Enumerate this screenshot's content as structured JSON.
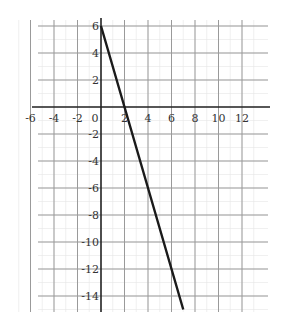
{
  "chart_data": {
    "type": "line",
    "title": "",
    "xlabel": "",
    "ylabel": "",
    "xlim": [
      -7,
      13
    ],
    "ylim": [
      -15.5,
      6.5
    ],
    "grid": true,
    "x_ticks": [
      -6,
      -4,
      -2,
      0,
      2,
      4,
      6,
      8,
      10,
      12
    ],
    "y_ticks": [
      6,
      4,
      2,
      -2,
      -4,
      -6,
      -8,
      -10,
      -12,
      -14
    ],
    "x_tick_labels": [
      "-6",
      "-4",
      "-2",
      "0",
      "2",
      "4",
      "6",
      "8",
      "10",
      "12"
    ],
    "y_tick_labels": [
      "6",
      "4",
      "2",
      "-2",
      "-4",
      "-6",
      "-8",
      "-10",
      "-12",
      "-14"
    ],
    "series": [
      {
        "name": "y = -3x + 6",
        "x": [
          0,
          2,
          7
        ],
        "y": [
          6,
          0,
          -15
        ],
        "color": "#1a1a1a"
      }
    ],
    "legend": null
  },
  "colors": {
    "grid": "#9a9a9a",
    "axis": "#222222",
    "line": "#1a1a1a"
  }
}
